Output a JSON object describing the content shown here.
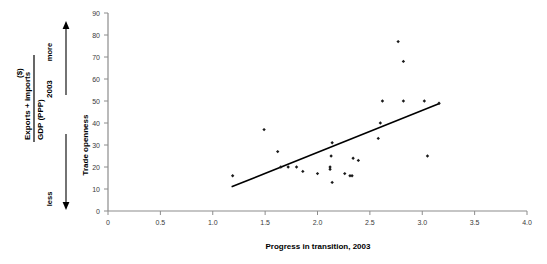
{
  "chart_data": {
    "type": "scatter",
    "title": "",
    "xlabel": "Progress in transition, 2003",
    "ylabel": "Trade openness",
    "xlim": [
      0,
      4.0
    ],
    "ylim": [
      0,
      90
    ],
    "xticks": [
      "0",
      "0.5",
      "1.0",
      "1.5",
      "2.0",
      "2.5",
      "3.0",
      "3.5",
      "4.0"
    ],
    "xtick_values": [
      0,
      0.5,
      1.0,
      1.5,
      2.0,
      2.5,
      3.0,
      3.5,
      4.0
    ],
    "yticks": [
      "0",
      "10",
      "20",
      "30",
      "40",
      "50",
      "60",
      "70",
      "80",
      "90"
    ],
    "ytick_values": [
      0,
      10,
      20,
      30,
      40,
      50,
      60,
      70,
      80,
      90
    ],
    "grid": false,
    "legend": null,
    "marker": "small-black-diamond",
    "marker_color": "#1a1a1a",
    "points": [
      {
        "x": 1.19,
        "y": 16
      },
      {
        "x": 1.49,
        "y": 37
      },
      {
        "x": 1.62,
        "y": 27
      },
      {
        "x": 1.65,
        "y": 20
      },
      {
        "x": 1.72,
        "y": 20
      },
      {
        "x": 1.8,
        "y": 20
      },
      {
        "x": 1.86,
        "y": 18
      },
      {
        "x": 2.0,
        "y": 17
      },
      {
        "x": 2.12,
        "y": 19
      },
      {
        "x": 2.12,
        "y": 20
      },
      {
        "x": 2.13,
        "y": 25
      },
      {
        "x": 2.14,
        "y": 31
      },
      {
        "x": 2.14,
        "y": 13
      },
      {
        "x": 2.26,
        "y": 17
      },
      {
        "x": 2.31,
        "y": 16
      },
      {
        "x": 2.33,
        "y": 16
      },
      {
        "x": 2.34,
        "y": 24
      },
      {
        "x": 2.39,
        "y": 23
      },
      {
        "x": 2.58,
        "y": 33
      },
      {
        "x": 2.6,
        "y": 40
      },
      {
        "x": 2.62,
        "y": 50
      },
      {
        "x": 2.77,
        "y": 77
      },
      {
        "x": 2.82,
        "y": 68
      },
      {
        "x": 2.82,
        "y": 50
      },
      {
        "x": 3.02,
        "y": 50
      },
      {
        "x": 3.05,
        "y": 25
      },
      {
        "x": 3.16,
        "y": 49
      }
    ],
    "trendline": {
      "type": "linear-fit",
      "x_start": 1.18,
      "y_start": 11,
      "x_end": 3.17,
      "y_end": 49,
      "color": "#000000"
    },
    "annotations": {
      "y_axis_caption_numerator": "Exports + imports",
      "y_axis_caption_unit": "($)",
      "y_axis_caption_denominator": "GDP (PPP)",
      "y_axis_caption_year": "2003",
      "direction_high": "more",
      "direction_low": "less"
    }
  },
  "axes": {
    "x_title": "Progress in transition, 2003",
    "y_title": "Trade openness"
  }
}
